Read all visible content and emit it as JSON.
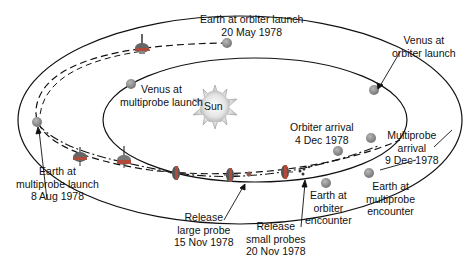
{
  "sun": {
    "label": "Sun"
  },
  "labels": {
    "earth_orbiter_launch": [
      "Earth at orbiter launch",
      "20 May 1978"
    ],
    "venus_orbiter_launch": [
      "Venus at",
      "orbiter launch"
    ],
    "venus_multiprobe_launch": [
      "Venus at",
      "multiprobe launch"
    ],
    "orbiter_arrival": [
      "Orbiter arrival",
      "4 Dec 1978"
    ],
    "multiprobe_arrival": [
      "Multiprobe",
      "arrival",
      "9 Dec 1978"
    ],
    "earth_multiprobe_launch": [
      "Earth at",
      "multiprobe launch",
      "8 Aug 1978"
    ],
    "earth_orbiter_encounter": [
      "Earth at",
      "orbiter",
      "encounter"
    ],
    "earth_multiprobe_encounter": [
      "Earth at",
      "multiprobe",
      "encounter"
    ],
    "release_large_probe": [
      "Release",
      "large probe",
      "15 Nov 1978"
    ],
    "release_small_probes": [
      "Release",
      "small probes",
      "20 Nov 1978"
    ]
  },
  "colors": {
    "orbit": "#111111",
    "planet": "#8c8c8c",
    "spacecraft_body": "#b04a3a",
    "spacecraft_top": "#555555",
    "sun_fill": "#e6e6e6"
  }
}
